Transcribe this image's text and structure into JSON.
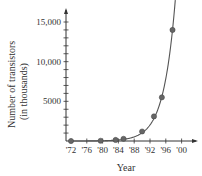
{
  "chart_data": {
    "type": "line",
    "title": "",
    "xlabel": "Year",
    "ylabel": "Number of transistors",
    "ylabel_sub": "(in thousands)",
    "x_ticks": [
      "'72",
      "'76",
      "'80",
      "'84",
      "'88",
      "'92",
      "'96",
      "'00"
    ],
    "x_tick_years": [
      1972,
      1976,
      1980,
      1984,
      1988,
      1992,
      1996,
      2000
    ],
    "y_ticks": [
      5000,
      10000,
      15000
    ],
    "y_tick_labels": [
      "5000",
      "10,000",
      "15,000"
    ],
    "y_minor_step": 1000,
    "xlim": [
      1972,
      2002
    ],
    "ylim": [
      0,
      16500
    ],
    "grid": false,
    "legend": null,
    "series": [
      {
        "name": "Transistors (thousands)",
        "points": [
          {
            "x": 1972,
            "y": 2
          },
          {
            "x": 1979.5,
            "y": 29
          },
          {
            "x": 1983.3,
            "y": 134
          },
          {
            "x": 1985.3,
            "y": 275
          },
          {
            "x": 1990,
            "y": 1200
          },
          {
            "x": 1993,
            "y": 3100
          },
          {
            "x": 1995,
            "y": 5500
          },
          {
            "x": 1997.7,
            "y": 14000
          }
        ],
        "curve": "exponential fit"
      }
    ],
    "colors": {
      "axis": "#333333",
      "curve": "#555555",
      "marker": "#666666"
    }
  }
}
